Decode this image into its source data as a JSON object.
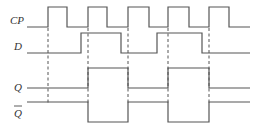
{
  "diagram": {
    "type": "timing-diagram",
    "signals": [
      {
        "name": "CP",
        "label": "CP",
        "y_high": 7,
        "y_low": 27,
        "points": [
          [
            27,
            27
          ],
          [
            48,
            27
          ],
          [
            48,
            7
          ],
          [
            67,
            7
          ],
          [
            67,
            27
          ],
          [
            88,
            27
          ],
          [
            88,
            7
          ],
          [
            107,
            7
          ],
          [
            107,
            27
          ],
          [
            128,
            27
          ],
          [
            128,
            7
          ],
          [
            149,
            7
          ],
          [
            149,
            27
          ],
          [
            168,
            27
          ],
          [
            168,
            7
          ],
          [
            189,
            7
          ],
          [
            189,
            27
          ],
          [
            209,
            27
          ],
          [
            209,
            7
          ],
          [
            229,
            7
          ],
          [
            229,
            27
          ],
          [
            250,
            27
          ]
        ]
      },
      {
        "name": "D",
        "label": "D",
        "y_high": 33,
        "y_low": 53,
        "points": [
          [
            27,
            53
          ],
          [
            81,
            53
          ],
          [
            81,
            33
          ],
          [
            121,
            33
          ],
          [
            121,
            53
          ],
          [
            157,
            53
          ],
          [
            157,
            33
          ],
          [
            202,
            33
          ],
          [
            202,
            53
          ],
          [
            250,
            53
          ]
        ]
      },
      {
        "name": "Q",
        "label": "Q",
        "y_high": 68,
        "y_low": 88,
        "points": [
          [
            27,
            88
          ],
          [
            88,
            88
          ],
          [
            88,
            68
          ],
          [
            128,
            68
          ],
          [
            128,
            88
          ],
          [
            168,
            88
          ],
          [
            168,
            68
          ],
          [
            209,
            68
          ],
          [
            209,
            88
          ],
          [
            250,
            88
          ]
        ]
      },
      {
        "name": "Q_bar",
        "label": "Q",
        "overbar": true,
        "y_high": 102,
        "y_low": 122,
        "points": [
          [
            27,
            102
          ],
          [
            88,
            102
          ],
          [
            88,
            122
          ],
          [
            128,
            122
          ],
          [
            128,
            102
          ],
          [
            168,
            102
          ],
          [
            168,
            122
          ],
          [
            209,
            122
          ],
          [
            209,
            102
          ],
          [
            250,
            102
          ]
        ]
      }
    ],
    "dashed_markers": [
      {
        "x": 48,
        "y1": 28,
        "y2": 103
      },
      {
        "x": 88,
        "y1": 28,
        "y2": 103
      },
      {
        "x": 128,
        "y1": 28,
        "y2": 103
      },
      {
        "x": 168,
        "y1": 28,
        "y2": 103
      },
      {
        "x": 209,
        "y1": 28,
        "y2": 103
      }
    ]
  },
  "labels": {
    "cp": "CP",
    "d": "D",
    "q": "Q",
    "q_bar": "Q"
  }
}
